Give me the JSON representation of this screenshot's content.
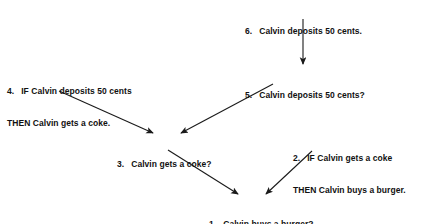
{
  "diagram": {
    "type": "inference-tree",
    "background_color": "#ffffff",
    "text_color": "#111111",
    "arrow_color": "#1a1a1a",
    "nodes": [
      {
        "id": "node-6",
        "number": "6.",
        "lines": [
          "Calvin deposits 50 cents."
        ],
        "x": 245,
        "y": 5
      },
      {
        "id": "node-5",
        "number": "5.",
        "lines": [
          "Calvin deposits 50 cents?"
        ],
        "x": 245,
        "y": 69
      },
      {
        "id": "node-4",
        "number": "4.",
        "lines": [
          "IF Calvin deposits 50 cents",
          "THEN Calvin gets a coke."
        ],
        "x": 7,
        "y": 65
      },
      {
        "id": "node-3",
        "number": "3.",
        "lines": [
          "Calvin gets a coke?"
        ],
        "x": 117,
        "y": 138
      },
      {
        "id": "node-2",
        "number": "2.",
        "lines": [
          "IF Calvin gets a coke",
          "THEN Calvin buys a burger."
        ],
        "x": 293,
        "y": 132
      },
      {
        "id": "node-1",
        "number": "1.",
        "lines": [
          "Calvin buys a burger?"
        ],
        "x": 209,
        "y": 198
      }
    ],
    "edges": [
      {
        "id": "edge-6-to-5",
        "from": "node-6",
        "to": "node-5",
        "x1": 303,
        "y1": 19,
        "x2": 303,
        "y2": 64
      },
      {
        "id": "edge-4-to-3",
        "from": "node-4",
        "to": "node-3",
        "x1": 59,
        "y1": 91,
        "x2": 153,
        "y2": 133
      },
      {
        "id": "edge-5-to-3",
        "from": "node-5",
        "to": "node-3",
        "x1": 273,
        "y1": 84,
        "x2": 181,
        "y2": 133
      },
      {
        "id": "edge-3-to-1",
        "from": "node-3",
        "to": "node-1",
        "x1": 168,
        "y1": 150,
        "x2": 238,
        "y2": 194
      },
      {
        "id": "edge-2-to-1",
        "from": "node-2",
        "to": "node-1",
        "x1": 312,
        "y1": 151,
        "x2": 266,
        "y2": 194
      }
    ]
  }
}
